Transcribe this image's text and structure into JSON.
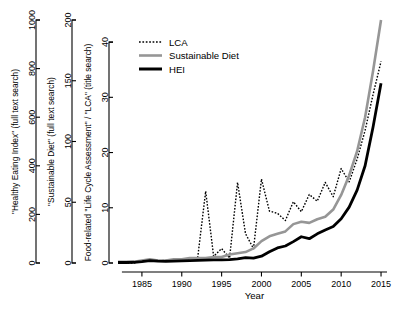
{
  "chart_data": {
    "type": "line",
    "title": "",
    "xlabel": "Year",
    "ylabel": "",
    "grid": false,
    "legend_position": "top-left",
    "x": [
      1982,
      1983,
      1984,
      1985,
      1986,
      1987,
      1988,
      1989,
      1990,
      1991,
      1992,
      1993,
      1994,
      1995,
      1996,
      1997,
      1998,
      1999,
      2000,
      2001,
      2002,
      2003,
      2004,
      2005,
      2006,
      2007,
      2008,
      2009,
      2010,
      2011,
      2012,
      2013,
      2014,
      2015
    ],
    "xlim": [
      1982,
      2016
    ],
    "xticks": [
      1985,
      1990,
      1995,
      2000,
      2005,
      2010,
      2015
    ],
    "axes": [
      {
        "id": "hei-axis",
        "label": "\"Healthy Eating Index\" (full text search)",
        "ticks": [
          0,
          200,
          400,
          600,
          800,
          1000
        ],
        "ylim": [
          0,
          1000
        ],
        "series": "HEI"
      },
      {
        "id": "sustainable-diet-axis",
        "label": "\"Sustainable Diet\" (full text search)",
        "ticks": [
          0,
          50,
          100,
          150,
          200
        ],
        "ylim": [
          0,
          200
        ],
        "series": "Sustainable Diet"
      },
      {
        "id": "lca-axis",
        "label": "Food-related \"Life Cycle Assessment\" / \"LCA\" (title search)",
        "ticks": [
          0,
          10,
          20,
          30,
          40
        ],
        "ylim": [
          0,
          44
        ],
        "series": "LCA"
      }
    ],
    "series": [
      {
        "name": "LCA",
        "style": "dotted",
        "color": "#000000",
        "width": 1.4,
        "axis": "lca-axis",
        "values": [
          0,
          0,
          0,
          0.3,
          0.6,
          0.4,
          0.5,
          0.6,
          0.7,
          0.8,
          1.0,
          13.0,
          1.2,
          2.6,
          0.9,
          14.6,
          5.3,
          2.6,
          15.2,
          9.4,
          9.0,
          7.7,
          11.1,
          9.3,
          12.4,
          11.2,
          14.6,
          12.0,
          17.1,
          14.7,
          18.8,
          24.0,
          30.5,
          36.5
        ]
      },
      {
        "name": "Sustainable Diet",
        "style": "solid",
        "color": "#969696",
        "width": 2.6,
        "axis": "sustainable-diet-axis",
        "values": [
          1,
          1,
          1,
          2,
          3,
          2,
          2,
          3,
          3,
          4,
          4,
          4,
          5,
          5,
          7,
          8,
          9,
          12,
          18,
          22,
          24,
          26,
          32,
          34,
          33,
          36,
          38,
          44,
          56,
          72,
          92,
          120,
          158,
          200
        ]
      },
      {
        "name": "HEI",
        "style": "solid",
        "color": "#000000",
        "width": 2.8,
        "axis": "hei-axis",
        "values": [
          2,
          2,
          3,
          6,
          10,
          8,
          7,
          8,
          9,
          10,
          11,
          12,
          13,
          13,
          14,
          17,
          22,
          20,
          28,
          46,
          62,
          70,
          88,
          108,
          100,
          120,
          136,
          150,
          182,
          230,
          300,
          400,
          560,
          740
        ]
      }
    ],
    "legend": [
      {
        "label": "LCA",
        "style": "dotted",
        "color": "#000000"
      },
      {
        "label": "Sustainable Diet",
        "style": "solid",
        "color": "#969696"
      },
      {
        "label": "HEI",
        "style": "solid",
        "color": "#000000"
      }
    ]
  }
}
